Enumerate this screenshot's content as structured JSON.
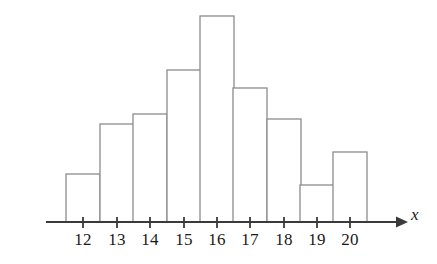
{
  "chart_data": {
    "type": "bar",
    "title": "",
    "subtitle": "",
    "xlabel": "x",
    "ylabel": "",
    "categories": [
      "12",
      "13",
      "14",
      "15",
      "16",
      "17",
      "18",
      "19",
      "20"
    ],
    "values": [
      48,
      98,
      108,
      152,
      206,
      134,
      103,
      37,
      70
    ],
    "bar_tops_px": [
      174,
      124,
      114,
      70,
      16,
      88,
      119,
      185,
      152
    ],
    "baseline_px": 222,
    "bar_width_px": 34,
    "bar_centers_px": [
      83,
      117,
      150,
      184,
      217,
      250,
      284,
      317,
      350
    ],
    "xlim": [
      11.5,
      20.5
    ],
    "ylim": [
      0,
      206
    ],
    "grid": false,
    "legend": null,
    "legend_position": "none",
    "tick_labels": [
      "12",
      "13",
      "14",
      "15",
      "16",
      "17",
      "18",
      "19",
      "20"
    ],
    "annotations": [],
    "axis_arrow": true,
    "bar_fill": "#ffffff",
    "bar_stroke": "#8c8c8c",
    "axis_color": "#3a3a3a",
    "text_color": "#1a1a1a"
  },
  "axis": {
    "x_axis_label": "x"
  },
  "ticks": [
    {
      "label": "12",
      "x": 83
    },
    {
      "label": "13",
      "x": 117
    },
    {
      "label": "14",
      "x": 150
    },
    {
      "label": "15",
      "x": 184
    },
    {
      "label": "16",
      "x": 217
    },
    {
      "label": "17",
      "x": 250
    },
    {
      "label": "18",
      "x": 284
    },
    {
      "label": "19",
      "x": 317
    },
    {
      "label": "20",
      "x": 350
    }
  ]
}
